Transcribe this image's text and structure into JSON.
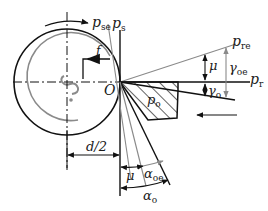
{
  "diagram": {
    "labels": {
      "p_se": {
        "main": "p",
        "sub": "se"
      },
      "p_s": {
        "main": "p",
        "sub": "s"
      },
      "p_re": {
        "main": "p",
        "sub": "re"
      },
      "p_r": {
        "main": "p",
        "sub": "r"
      },
      "p_o": {
        "main": "p",
        "sub": "o"
      },
      "O": "O",
      "f": "f",
      "mu_right": "μ",
      "gamma_oe": {
        "main": "γ",
        "sub": "oe"
      },
      "gamma_o": {
        "main": "γ",
        "sub": "o"
      },
      "d_half": "d/2",
      "mu_bottom": "μ",
      "alpha_oe": {
        "main": "α",
        "sub": "oe"
      },
      "alpha_o": {
        "main": "α",
        "sub": "o"
      }
    },
    "colors": {
      "primary_line": "#111111",
      "secondary_line": "#8a8a8a",
      "background": "#ffffff"
    }
  }
}
